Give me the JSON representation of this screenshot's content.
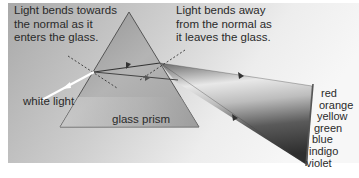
{
  "diagram": {
    "annotations": {
      "enter": [
        "Light bends towards",
        "the normal as it",
        "enters the glass."
      ],
      "leave": [
        "Light bends away",
        "from the normal as",
        "it leaves the glass."
      ]
    },
    "labels": {
      "incoming": "white light",
      "prism": "glass prism"
    },
    "spectrum": [
      "red",
      "orange",
      "yellow",
      "green",
      "blue",
      "indigo",
      "violet"
    ],
    "colors": {
      "background_light": "#f2f2f2",
      "background_dark": "#a8a8a8",
      "prism_fill": "#9c9c9c",
      "prism_edge": "#555555",
      "ray": "#3a3a3a",
      "white_ray": "#ffffff",
      "text": "#2a2a2a"
    }
  }
}
